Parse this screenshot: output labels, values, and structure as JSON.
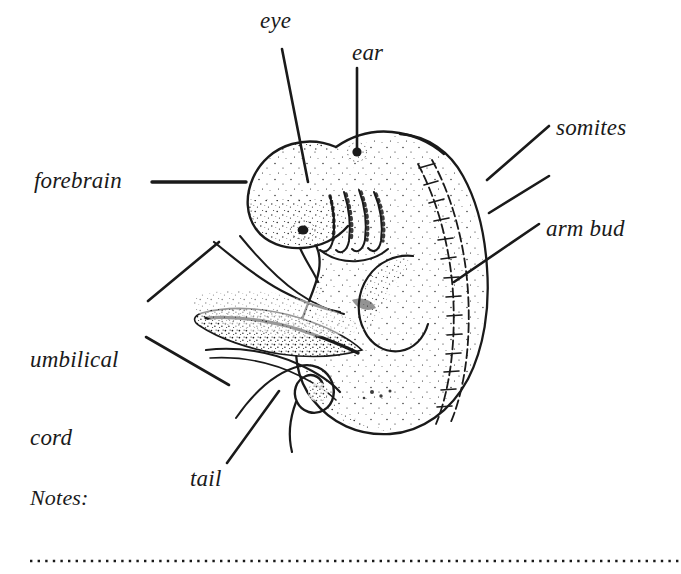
{
  "document": {
    "title": "Embryo anatomy worksheet",
    "background_color": "#ffffff",
    "ink_color": "#1a1a1a"
  },
  "labels": {
    "eye": "eye",
    "ear": "ear",
    "forebrain": "forebrain",
    "somites": "somites",
    "arm_bud": "arm bud",
    "umbilical_cord_line1": "umbilical",
    "umbilical_cord_line2": "cord",
    "tail": "tail",
    "notes": "Notes:"
  },
  "diagram": {
    "style": "stippled pen-and-ink line drawing",
    "parts": [
      "forebrain",
      "eye",
      "ear",
      "pharyngeal arches",
      "somites",
      "arm bud",
      "umbilical cord",
      "tail"
    ],
    "leader_lines": [
      {
        "label": "eye",
        "from": [
          282,
          49
        ],
        "to": [
          308,
          182
        ]
      },
      {
        "label": "ear",
        "from": [
          357,
          68
        ],
        "to": [
          357,
          152
        ]
      },
      {
        "label": "forebrain",
        "from": [
          152,
          182
        ],
        "to": [
          245,
          182
        ]
      },
      {
        "label": "somites",
        "from": [
          548,
          126
        ],
        "to": [
          488,
          180
        ]
      },
      {
        "label": "somites-second",
        "from": [
          548,
          176
        ],
        "to": [
          490,
          212
        ]
      },
      {
        "label": "arm-bud",
        "from": [
          538,
          224
        ],
        "to": [
          455,
          281
        ]
      },
      {
        "label": "umbilical-a",
        "from": [
          148,
          301
        ],
        "to": [
          218,
          243
        ]
      },
      {
        "label": "umbilical-b",
        "from": [
          146,
          337
        ],
        "to": [
          228,
          384
        ]
      },
      {
        "label": "tail",
        "from": [
          227,
          463
        ],
        "to": [
          278,
          392
        ]
      }
    ]
  },
  "notes_rule": {
    "style": "dotted",
    "x_start": 30,
    "x_end": 681,
    "y": 561
  }
}
